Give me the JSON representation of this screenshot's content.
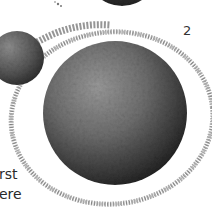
{
  "figure": {
    "label": "2",
    "caption_fragments": [
      "rst",
      "ere"
    ],
    "bodies": [
      {
        "name": "top-body",
        "cx": 122,
        "cy": -30,
        "r": 36
      },
      {
        "name": "moon",
        "cx": 17,
        "cy": 58,
        "r": 27
      },
      {
        "name": "planet",
        "cx": 115,
        "cy": 113,
        "r": 72
      }
    ],
    "ring": {
      "cx": 112,
      "cy": 118,
      "rx": 101,
      "ry": 86,
      "rotate": -6
    },
    "colors": {
      "background": "#ffffff",
      "body_light": "#8a8a8a",
      "body_dark": "#1e1e1e",
      "ring": "#8c8c8c",
      "text": "#2a2a2a"
    }
  }
}
